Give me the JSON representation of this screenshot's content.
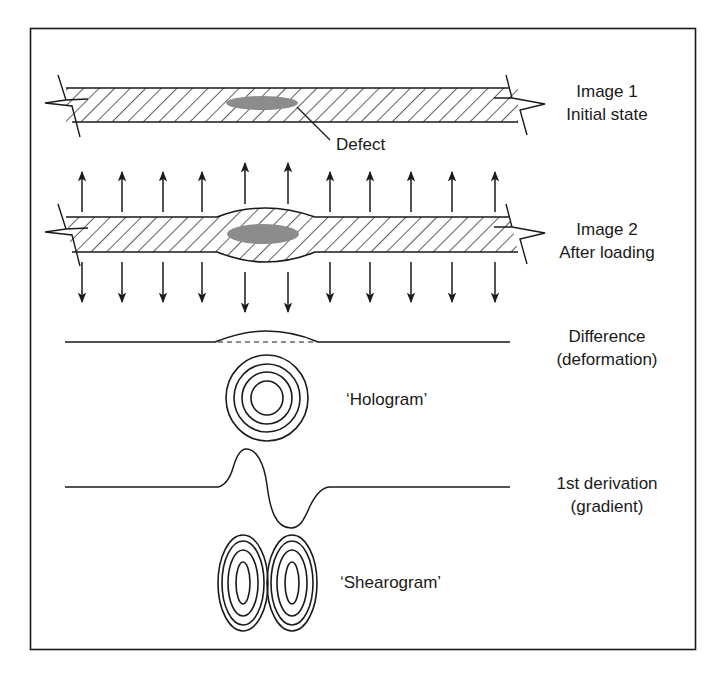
{
  "colors": {
    "stroke": "#1a1a1a",
    "defect_fill": "#8c8c8c",
    "background": "#ffffff"
  },
  "stages": [
    {
      "id": "image1",
      "line1": "Image 1",
      "line2": "Initial state"
    },
    {
      "id": "image2",
      "line1": "Image 2",
      "line2": "After loading"
    },
    {
      "id": "difference",
      "line1": "Difference",
      "line2": "(deformation)"
    },
    {
      "id": "derivation",
      "line1": "1st derivation",
      "line2": "(gradient)"
    }
  ],
  "annotations": {
    "defect": "Defect",
    "hologram": "‘Hologram’",
    "shearogram": "‘Shearogram’"
  },
  "loading": {
    "arrow_count": 11,
    "arrow_x": [
      82,
      122,
      163,
      202,
      245,
      288,
      330,
      370,
      411,
      452,
      495
    ],
    "direction": "tensile (up above, down below)"
  }
}
